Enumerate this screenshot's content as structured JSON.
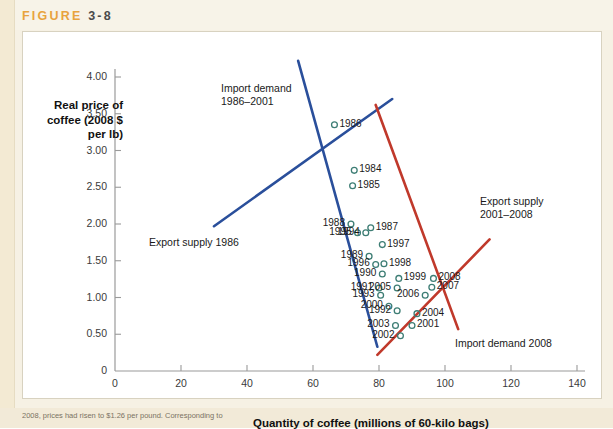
{
  "figure": {
    "label": "FIGURE",
    "number": "3-8",
    "caption_fragment": "2008, prices had risen to $1.26 per pound. Corresponding to"
  },
  "axes": {
    "y_title": "Real price\nof coffee\n(2008 $\nper lb)",
    "x_title": "Quantity of coffee (millions of 60-kilo bags)",
    "y_ticks": [
      "0",
      "0.50",
      "1.00",
      "1.50",
      "2.00",
      "2.50",
      "3.00",
      "3.50",
      "4.00"
    ],
    "x_ticks": [
      "0",
      "20",
      "40",
      "60",
      "80",
      "100",
      "120",
      "140"
    ]
  },
  "annotations": [
    {
      "name": "import-demand-1986-2001",
      "text": "Import demand\n1986–2001",
      "color": "#2a4f9b"
    },
    {
      "name": "export-supply-1986",
      "text": "Export supply 1986",
      "color": "#2a4f9b"
    },
    {
      "name": "export-supply-2001-2008",
      "text": "Export supply\n2001–2008",
      "color": "#c0392b"
    },
    {
      "name": "import-demand-2008",
      "text": "Import demand 2008",
      "color": "#c0392b"
    }
  ],
  "chart_data": {
    "type": "scatter",
    "title": "FIGURE 3-8",
    "xlabel": "Quantity of coffee (millions of 60-kilo bags)",
    "ylabel": "Real price of coffee (2008 $ per lb)",
    "xlim": [
      0,
      140
    ],
    "ylim": [
      0,
      4.0
    ],
    "xticks": [
      0,
      20,
      40,
      60,
      80,
      100,
      120,
      140
    ],
    "yticks": [
      0,
      0.5,
      1.0,
      1.5,
      2.0,
      2.5,
      3.0,
      3.5,
      4.0
    ],
    "grid": false,
    "legend": "annotations-inline",
    "marker_color": "#3d7d74",
    "points": [
      {
        "label": "1986",
        "x": 66.5,
        "y": 3.35
      },
      {
        "label": "1984",
        "x": 72.5,
        "y": 2.73
      },
      {
        "label": "1985",
        "x": 72.0,
        "y": 2.52
      },
      {
        "label": "1988",
        "x": 71.5,
        "y": 2.0
      },
      {
        "label": "1995",
        "x": 73.5,
        "y": 1.88
      },
      {
        "label": "1994",
        "x": 76.0,
        "y": 1.88
      },
      {
        "label": "1987",
        "x": 77.5,
        "y": 1.95
      },
      {
        "label": "1997",
        "x": 81.0,
        "y": 1.72
      },
      {
        "label": "1989",
        "x": 77.0,
        "y": 1.56
      },
      {
        "label": "1996",
        "x": 79.0,
        "y": 1.45
      },
      {
        "label": "1998",
        "x": 81.5,
        "y": 1.46
      },
      {
        "label": "1990",
        "x": 81.0,
        "y": 1.32
      },
      {
        "label": "1999",
        "x": 86.0,
        "y": 1.26
      },
      {
        "label": "2008",
        "x": 96.5,
        "y": 1.26
      },
      {
        "label": "2007",
        "x": 96.0,
        "y": 1.14
      },
      {
        "label": "1991",
        "x": 80.0,
        "y": 1.13
      },
      {
        "label": "2005",
        "x": 85.5,
        "y": 1.13
      },
      {
        "label": "1993",
        "x": 80.5,
        "y": 1.03
      },
      {
        "label": "2006",
        "x": 94.0,
        "y": 1.03
      },
      {
        "label": "2000",
        "x": 83.0,
        "y": 0.88
      },
      {
        "label": "1992",
        "x": 85.5,
        "y": 0.82
      },
      {
        "label": "2004",
        "x": 91.5,
        "y": 0.78
      },
      {
        "label": "2003",
        "x": 85.0,
        "y": 0.62
      },
      {
        "label": "2001",
        "x": 90.0,
        "y": 0.62
      },
      {
        "label": "2002",
        "x": 86.5,
        "y": 0.48
      }
    ],
    "lines": [
      {
        "name": "import-demand-1986-2001",
        "color": "#2a4f9b",
        "x1": 55.5,
        "y1": 4.22,
        "x2": 79.5,
        "y2": 0.33
      },
      {
        "name": "export-supply-1986",
        "color": "#2a4f9b",
        "x1": 30.0,
        "y1": 1.97,
        "x2": 84.0,
        "y2": 3.7
      },
      {
        "name": "import-demand-2008",
        "color": "#c0392b",
        "x1": 79.0,
        "y1": 3.62,
        "x2": 104.0,
        "y2": 0.57
      },
      {
        "name": "export-supply-2001-2008",
        "color": "#c0392b",
        "x1": 79.5,
        "y1": 0.22,
        "x2": 113.5,
        "y2": 1.79
      }
    ]
  }
}
